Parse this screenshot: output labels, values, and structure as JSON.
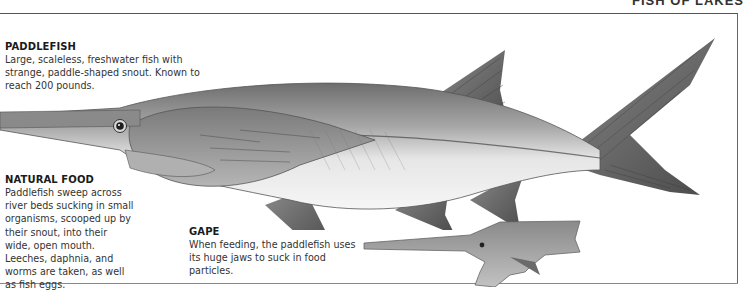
{
  "page": {
    "running_head": "FISH OF LAKES"
  },
  "captions": {
    "paddlefish": {
      "title": "PADDLEFISH",
      "body": "Large, scaleless, freshwater fish with strange, paddle-shaped snout. Known to reach 200 pounds."
    },
    "natural_food": {
      "title": "NATURAL FOOD",
      "body": "Paddlefish sweep across river beds sucking in small organisms, scooped up by their snout, into their wide, open mouth. Leeches, daphnia, and worms are taken, as well as fish eggs."
    },
    "gape": {
      "title": "GAPE",
      "body": "When feeding, the paddlefish uses its huge jaws to suck in food particles."
    }
  },
  "illustrations": {
    "main": {
      "subject": "paddlefish-side-view"
    },
    "inset": {
      "subject": "paddlefish-gape-open-mouth"
    }
  },
  "colors": {
    "fin_dark": "#5a5a5a",
    "body_mid": "#9a9a9a",
    "belly": "#f0f0f0",
    "frame": "#555555"
  }
}
